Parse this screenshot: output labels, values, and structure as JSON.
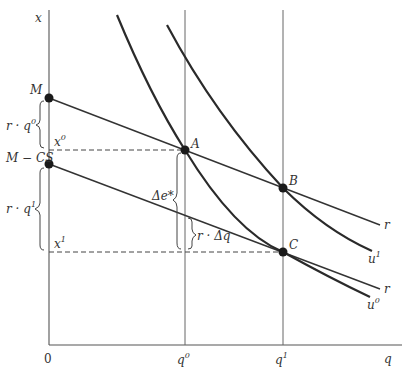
{
  "diagram": {
    "axes": {
      "y_label": "x",
      "x_label": "q",
      "origin_label": "0"
    },
    "x_ticks": [
      {
        "base": "q",
        "sup": "0"
      },
      {
        "base": "q",
        "sup": "1"
      }
    ],
    "y_ticks": [
      {
        "id": "M",
        "label": "M"
      },
      {
        "id": "M-CS",
        "label": "M − CS"
      },
      {
        "id": "x0",
        "base": "x",
        "sup": "0"
      },
      {
        "id": "x1",
        "base": "x",
        "sup": "1"
      }
    ],
    "points": [
      {
        "id": "A",
        "label": "A"
      },
      {
        "id": "B",
        "label": "B"
      },
      {
        "id": "C",
        "label": "C"
      }
    ],
    "lines": {
      "budget_upper": {
        "label": "r"
      },
      "budget_lower": {
        "label": "r"
      }
    },
    "curves": {
      "u0": {
        "base": "u",
        "sup": "0"
      },
      "u1": {
        "base": "u",
        "sup": "1"
      }
    },
    "braces": {
      "r_q0": "r · q",
      "r_q0_sup": "0",
      "r_q1": "r · q",
      "r_q1_sup": "1",
      "delta_e": "Δe*",
      "r_dq": "r · Δq"
    }
  }
}
